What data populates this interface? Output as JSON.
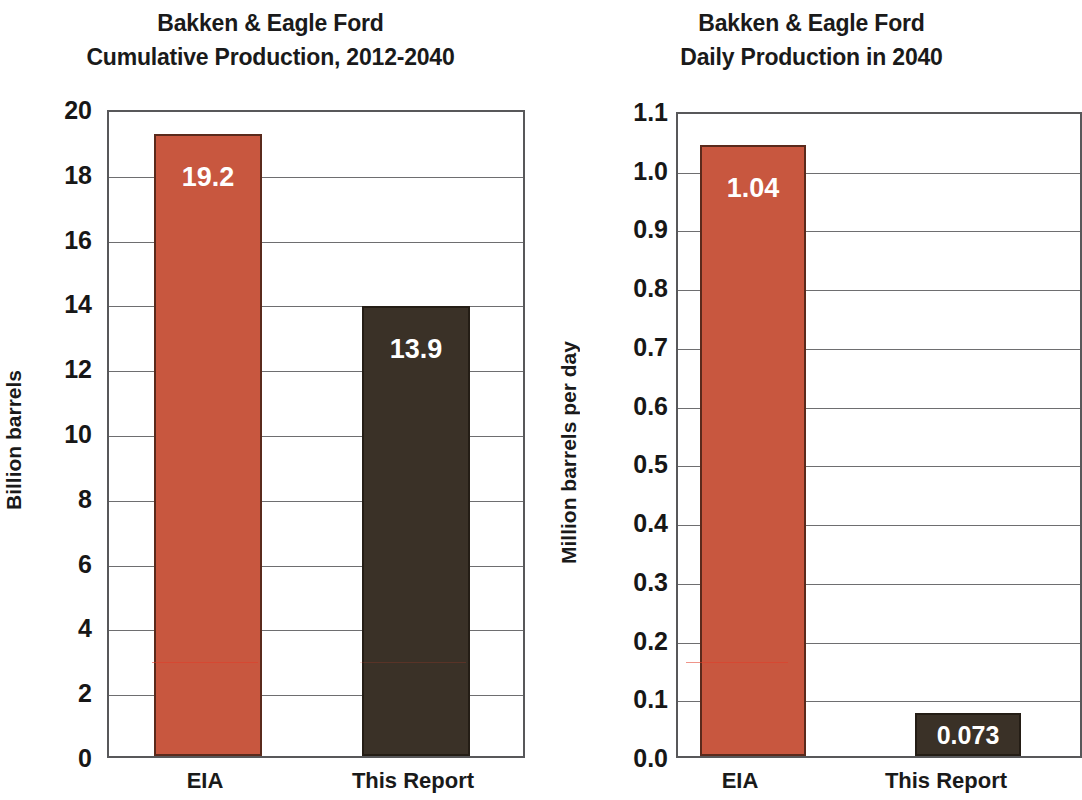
{
  "figure": {
    "background_color": "#ffffff",
    "panels": [
      {
        "id": "cumulative-production",
        "title_line1": "Bakken & Eagle Ford",
        "title_line2": "Cumulative Production, 2012-2040",
        "ylabel": "Billion barrels",
        "categories": [
          "EIA",
          "This Report"
        ],
        "values": [
          19.2,
          13.9
        ],
        "labels": [
          "19.2",
          "13.9"
        ],
        "ticks": [
          "20",
          "18",
          "16",
          "14",
          "12",
          "10",
          "8",
          "6",
          "4",
          "2",
          "0"
        ],
        "ymin": 0,
        "ymax": 20,
        "colors": [
          "#c8573f",
          "#3a3127"
        ]
      },
      {
        "id": "daily-production",
        "title_line1": "Bakken & Eagle Ford",
        "title_line2": "Daily Production in 2040",
        "ylabel": "Million barrels per day",
        "categories": [
          "EIA",
          "This Report"
        ],
        "values": [
          1.04,
          0.073
        ],
        "labels": [
          "1.04",
          "0.073"
        ],
        "ticks": [
          "1.1",
          "1.0",
          "0.9",
          "0.8",
          "0.7",
          "0.6",
          "0.5",
          "0.4",
          "0.3",
          "0.2",
          "0.1",
          "0.0"
        ],
        "ymin": 0,
        "ymax": 1.1,
        "colors": [
          "#c8573f",
          "#3a3127"
        ]
      }
    ]
  },
  "chart_data": [
    {
      "type": "bar",
      "title": "Bakken & Eagle Ford Cumulative Production, 2012-2040",
      "subtitle": "Cumulative Production, 2012-2040",
      "categories": [
        "EIA",
        "This Report"
      ],
      "values": [
        19.2,
        13.9
      ],
      "data_labels": [
        "19.2",
        "13.9"
      ],
      "xlabel": "",
      "ylabel": "Billion barrels",
      "ylim": [
        0,
        20
      ],
      "ytick_labels": [
        "0",
        "2",
        "4",
        "6",
        "8",
        "10",
        "12",
        "14",
        "16",
        "18",
        "20"
      ],
      "ytick_step": 2,
      "grid": "horizontal",
      "legend": "none",
      "series_colors": [
        "#c8573f",
        "#3a3127"
      ]
    },
    {
      "type": "bar",
      "title": "Bakken & Eagle Ford Daily Production in 2040",
      "subtitle": "Daily Production in 2040",
      "categories": [
        "EIA",
        "This Report"
      ],
      "values": [
        1.04,
        0.073
      ],
      "data_labels": [
        "1.04",
        "0.073"
      ],
      "xlabel": "",
      "ylabel": "Million barrels per day",
      "ylim": [
        0,
        1.1
      ],
      "ytick_labels": [
        "0.0",
        "0.1",
        "0.2",
        "0.3",
        "0.4",
        "0.5",
        "0.6",
        "0.7",
        "0.8",
        "0.9",
        "1.0",
        "1.1"
      ],
      "ytick_step": 0.1,
      "grid": "horizontal",
      "legend": "none",
      "series_colors": [
        "#c8573f",
        "#3a3127"
      ]
    }
  ]
}
